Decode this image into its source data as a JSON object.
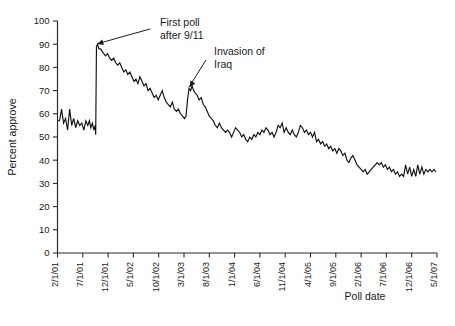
{
  "chart_data": {
    "type": "line",
    "title": "",
    "xlabel": "Poll date",
    "ylabel": "Percent approve",
    "ylim": [
      0,
      100
    ],
    "ytick_step": 10,
    "grid": false,
    "legend": "none",
    "line_color": "#111111",
    "ytick_labels": [
      "0",
      "10",
      "20",
      "30",
      "40",
      "50",
      "60",
      "70",
      "80",
      "90",
      "100"
    ],
    "ytick_values": [
      0,
      10,
      20,
      30,
      40,
      50,
      60,
      70,
      80,
      90,
      100
    ],
    "xtick_labels": [
      "2/1/01",
      "7/1/01",
      "12/1/01",
      "5/1/02",
      "10/1/02",
      "3/1/03",
      "8/1/03",
      "1/1/04",
      "6/1/04",
      "11/1/04",
      "4/1/05",
      "9/1/05",
      "2/1/06",
      "7/1/06",
      "12/1/06",
      "5/1/07"
    ],
    "xtick_months": [
      0,
      5,
      10,
      15,
      20,
      25,
      30,
      35,
      40,
      45,
      50,
      55,
      60,
      65,
      70,
      75
    ],
    "x_range_months": [
      0,
      75
    ],
    "annotations": [
      {
        "name": "first-poll-after-911",
        "line1": "First poll",
        "line2": "after 9/11",
        "target_month": 7.6,
        "target_value": 90
      },
      {
        "name": "invasion-of-iraq",
        "line1": "Invasion of",
        "line2": "Iraq",
        "target_month": 26.0,
        "target_value": 71
      }
    ],
    "series": [
      {
        "name": "Presidential approval",
        "x": [
          0.0,
          0.4,
          0.8,
          1.2,
          1.6,
          2.0,
          2.4,
          2.8,
          3.2,
          3.6,
          4.0,
          4.4,
          4.8,
          5.2,
          5.6,
          6.0,
          6.3,
          6.6,
          6.9,
          7.2,
          7.45,
          7.55,
          7.7,
          7.9,
          8.2,
          8.5,
          8.8,
          9.1,
          9.5,
          9.9,
          10.3,
          10.7,
          11.1,
          11.5,
          11.9,
          12.3,
          12.7,
          13.1,
          13.5,
          13.9,
          14.3,
          14.7,
          15.1,
          15.5,
          15.9,
          16.3,
          16.7,
          17.1,
          17.5,
          17.9,
          18.3,
          18.7,
          19.1,
          19.5,
          19.9,
          20.3,
          20.7,
          21.1,
          21.5,
          21.9,
          22.3,
          22.7,
          23.1,
          23.5,
          23.9,
          24.3,
          24.7,
          25.1,
          25.4,
          25.7,
          26.0,
          26.3,
          26.6,
          26.9,
          27.2,
          27.6,
          28.0,
          28.4,
          28.8,
          29.2,
          29.6,
          30.0,
          30.4,
          30.8,
          31.2,
          31.6,
          32.0,
          32.4,
          32.8,
          33.2,
          33.6,
          34.0,
          34.4,
          34.8,
          35.2,
          35.6,
          36.0,
          36.4,
          36.8,
          37.2,
          37.6,
          38.0,
          38.4,
          38.8,
          39.2,
          39.6,
          40.0,
          40.4,
          40.8,
          41.2,
          41.6,
          42.0,
          42.4,
          42.8,
          43.2,
          43.6,
          44.0,
          44.4,
          44.8,
          45.2,
          45.6,
          46.0,
          46.4,
          46.8,
          47.2,
          47.6,
          48.0,
          48.4,
          48.8,
          49.2,
          49.6,
          50.0,
          50.4,
          50.8,
          51.2,
          51.6,
          52.0,
          52.4,
          52.8,
          53.2,
          53.6,
          54.0,
          54.4,
          54.8,
          55.2,
          55.6,
          56.0,
          56.4,
          56.8,
          57.2,
          57.6,
          58.0,
          58.4,
          58.8,
          59.2,
          59.6,
          60.0,
          60.4,
          60.8,
          61.2,
          61.6,
          62.0,
          62.4,
          62.8,
          63.2,
          63.6,
          64.0,
          64.4,
          64.8,
          65.2,
          65.6,
          66.0,
          66.4,
          66.8,
          67.2,
          67.6,
          68.0,
          68.4,
          68.8,
          69.2,
          69.6,
          70.0,
          70.4,
          70.8,
          71.2,
          71.6,
          72.0,
          72.4,
          72.8,
          73.2,
          73.6,
          74.0,
          74.4,
          74.8
        ],
        "y": [
          57,
          57,
          62,
          56,
          58,
          53,
          62,
          55,
          58,
          54,
          57,
          55,
          56,
          53,
          57,
          55,
          57,
          54,
          56,
          53,
          55,
          51,
          89,
          90,
          88,
          88,
          87,
          86,
          85,
          86,
          84,
          83,
          84,
          82,
          81,
          82,
          80,
          78,
          79,
          77,
          78,
          76,
          74,
          75,
          73,
          76,
          74,
          72,
          73,
          70,
          71,
          69,
          67,
          68,
          66,
          68,
          70,
          67,
          65,
          64,
          63,
          65,
          62,
          61,
          62,
          60,
          59,
          58,
          59,
          66,
          71,
          70,
          72,
          70,
          69,
          68,
          66,
          67,
          64,
          63,
          61,
          59,
          58,
          57,
          55,
          54,
          56,
          54,
          53,
          52,
          53,
          52,
          50,
          52,
          54,
          53,
          52,
          50,
          51,
          49,
          48,
          50,
          49,
          51,
          50,
          52,
          51,
          53,
          52,
          54,
          53,
          51,
          52,
          50,
          52,
          55,
          54,
          56,
          52,
          54,
          52,
          51,
          53,
          51,
          50,
          52,
          55,
          54,
          52,
          53,
          51,
          52,
          50,
          52,
          48,
          49,
          47,
          48,
          46,
          47,
          45,
          46,
          44,
          45,
          43,
          45,
          44,
          42,
          43,
          40,
          39,
          41,
          42,
          40,
          38,
          37,
          36,
          35,
          36,
          34,
          35,
          36,
          37,
          38,
          39,
          38,
          39,
          37,
          38,
          36,
          37,
          35,
          36,
          34,
          35,
          33,
          34,
          33,
          38,
          34,
          37,
          33,
          36,
          33,
          38,
          34,
          37,
          34,
          36,
          35,
          36,
          35,
          36,
          35
        ]
      }
    ]
  }
}
